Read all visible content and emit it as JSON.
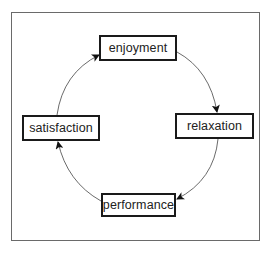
{
  "diagram": {
    "type": "cycle",
    "nodes": [
      {
        "id": "enjoyment",
        "label": "enjoyment"
      },
      {
        "id": "relaxation",
        "label": "relaxation"
      },
      {
        "id": "performance",
        "label": "performance"
      },
      {
        "id": "satisfaction",
        "label": "satisfaction"
      }
    ],
    "edges": [
      {
        "from": "enjoyment",
        "to": "relaxation"
      },
      {
        "from": "relaxation",
        "to": "performance"
      },
      {
        "from": "performance",
        "to": "satisfaction"
      },
      {
        "from": "satisfaction",
        "to": "enjoyment"
      }
    ],
    "direction": "clockwise"
  }
}
